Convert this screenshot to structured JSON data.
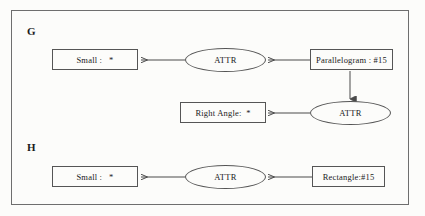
{
  "diagram": {
    "type": "graph-pair",
    "sections": [
      {
        "id": "G",
        "label": "G",
        "nodes": [
          {
            "id": "g-small",
            "kind": "box",
            "text": "Small :   *"
          },
          {
            "id": "g-attr1",
            "kind": "ellipse",
            "text": "ATTR"
          },
          {
            "id": "g-par",
            "kind": "box",
            "text": "Parallelogram : #15"
          },
          {
            "id": "g-right",
            "kind": "box",
            "text": "Right Angle:  *"
          },
          {
            "id": "g-attr2",
            "kind": "ellipse",
            "text": "ATTR"
          }
        ],
        "edges": [
          {
            "from": "g-par",
            "to": "g-attr1",
            "direction": "left"
          },
          {
            "from": "g-attr1",
            "to": "g-small",
            "direction": "left"
          },
          {
            "from": "g-par",
            "to": "g-attr2",
            "direction": "down"
          },
          {
            "from": "g-attr2",
            "to": "g-right",
            "direction": "left"
          }
        ]
      },
      {
        "id": "H",
        "label": "H",
        "nodes": [
          {
            "id": "h-small",
            "kind": "box",
            "text": "Small :   *"
          },
          {
            "id": "h-attr",
            "kind": "ellipse",
            "text": "ATTR"
          },
          {
            "id": "h-rect",
            "kind": "box",
            "text": "Rectangle:#15"
          }
        ],
        "edges": [
          {
            "from": "h-rect",
            "to": "h-attr",
            "direction": "left"
          },
          {
            "from": "h-attr",
            "to": "h-small",
            "direction": "left"
          }
        ]
      }
    ]
  },
  "colors": {
    "background": "#fcfcfa",
    "frame_border": "#6e6e6e",
    "node_border": "#555555",
    "edge_stroke": "#4a4a4a",
    "text": "#1a1a1a"
  }
}
